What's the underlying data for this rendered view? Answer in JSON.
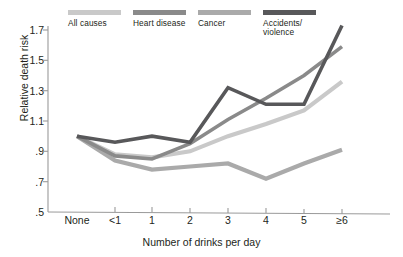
{
  "chart_data": {
    "type": "line",
    "title": "",
    "xlabel": "Number of drinks per day",
    "ylabel": "Relative death risk",
    "categories": [
      "None",
      "<1",
      "1",
      "2",
      "3",
      "4",
      "5",
      "≥6"
    ],
    "yticks": [
      "1.7",
      "1.5",
      "1.3",
      "1.1",
      ".9",
      ".7",
      ".5"
    ],
    "ytick_values": [
      1.7,
      1.5,
      1.3,
      1.1,
      0.9,
      0.7,
      0.5
    ],
    "ylim": [
      0.5,
      1.78
    ],
    "grid": false,
    "legend_position": "top",
    "series": [
      {
        "name": "All causes",
        "color": "#c9c9c9",
        "values": [
          1.0,
          0.88,
          0.86,
          0.9,
          1.0,
          1.08,
          1.17,
          1.36
        ]
      },
      {
        "name": "Heart disease",
        "color": "#8a8a8a",
        "values": [
          1.0,
          0.87,
          0.85,
          0.95,
          1.11,
          1.25,
          1.4,
          1.59
        ]
      },
      {
        "name": "Cancer",
        "color": "#aaaaaa",
        "values": [
          1.0,
          0.84,
          0.78,
          0.8,
          0.82,
          0.72,
          0.82,
          0.91
        ]
      },
      {
        "name": "Accidents/\nviolence",
        "color": "#58585a",
        "values": [
          1.0,
          0.96,
          1.0,
          0.96,
          1.32,
          1.21,
          1.21,
          1.73
        ]
      }
    ]
  },
  "legend": {
    "items": [
      {
        "label": "All causes",
        "color": "#c9c9c9"
      },
      {
        "label": "Heart disease",
        "color": "#8a8a8a"
      },
      {
        "label": "Cancer",
        "color": "#aaaaaa"
      },
      {
        "label": "Accidents/\nviolence",
        "color": "#58585a"
      }
    ]
  },
  "axis": {
    "color": "#9a9a9a",
    "label_color": "#231f20"
  }
}
